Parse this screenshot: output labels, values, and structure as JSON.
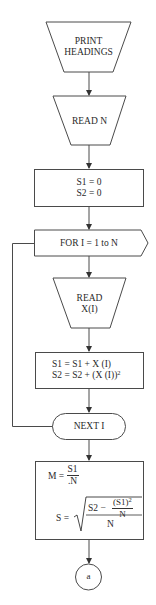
{
  "diagram": {
    "type": "flowchart",
    "stroke_color": "#4a4a4a",
    "background": "#ffffff",
    "nodes": [
      {
        "id": "print-headings",
        "shape": "manual-input-trapezoid",
        "lines": [
          "PRINT",
          "HEADINGS"
        ]
      },
      {
        "id": "read-n",
        "shape": "manual-input-trapezoid",
        "lines": [
          "READ N"
        ]
      },
      {
        "id": "init",
        "shape": "process",
        "lines": [
          "S1 = 0",
          "S2 = 0"
        ]
      },
      {
        "id": "for-loop",
        "shape": "preparation-arrow",
        "lines": [
          "FOR I = 1 to N"
        ]
      },
      {
        "id": "read-x",
        "shape": "manual-input-trapezoid",
        "lines": [
          "READ",
          "X(I)"
        ]
      },
      {
        "id": "accumulate",
        "shape": "process",
        "lines": [
          "S1 = S1 + X (I)",
          "S2 = S2 + (X (I))"
        ],
        "superscript": "2"
      },
      {
        "id": "next-i",
        "shape": "terminator",
        "lines": [
          "NEXT I"
        ]
      },
      {
        "id": "compute",
        "shape": "process",
        "mean": {
          "lhs": "M =",
          "num": "S1",
          "den": ".N"
        },
        "stddev": {
          "lhs": "S =",
          "inner_left": "S2 −",
          "inner_num": "(S1)",
          "inner_num_sup": "2",
          "inner_den": "N",
          "outer_den": "N"
        }
      },
      {
        "id": "connector-a",
        "shape": "connector-circle",
        "lines": [
          "a"
        ]
      }
    ],
    "edges": [
      [
        "print-headings",
        "read-n"
      ],
      [
        "read-n",
        "init"
      ],
      [
        "init",
        "for-loop"
      ],
      [
        "for-loop",
        "read-x"
      ],
      [
        "read-x",
        "accumulate"
      ],
      [
        "accumulate",
        "next-i"
      ],
      [
        "next-i",
        "for-loop",
        "loop-back"
      ],
      [
        "next-i",
        "compute"
      ],
      [
        "compute",
        "connector-a"
      ]
    ]
  }
}
